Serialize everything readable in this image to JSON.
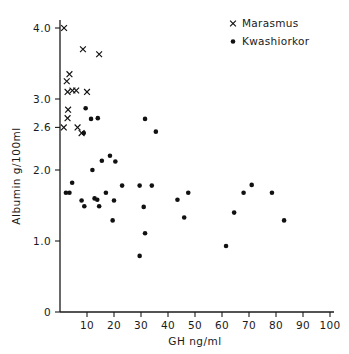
{
  "chart_data": {
    "type": "scatter",
    "title": "",
    "xlabel": "GH ng/ml",
    "ylabel": "Albumin g/100ml",
    "xlim": [
      0,
      100
    ],
    "ylim": [
      0,
      4.0
    ],
    "grid": false,
    "legend_position": "top-right",
    "xticks": [
      0,
      10,
      20,
      30,
      40,
      50,
      60,
      70,
      80,
      90,
      100
    ],
    "xtick_labels": [
      "",
      "10",
      "20",
      "30",
      "40",
      "50",
      "60",
      "70",
      "80",
      "90",
      "100"
    ],
    "yticks": [
      0,
      1.0,
      2.0,
      2.6,
      3.0,
      4.0
    ],
    "ytick_labels": [
      "0",
      "1.0",
      "2.0",
      "2.6",
      "3.0",
      "4.0"
    ],
    "series": [
      {
        "name": "Marasmus",
        "marker": "x",
        "color": "#111111",
        "points": [
          [
            1.5,
            4.0
          ],
          [
            8.5,
            3.7
          ],
          [
            14.5,
            3.63
          ],
          [
            3.5,
            3.35
          ],
          [
            2.5,
            3.25
          ],
          [
            2.8,
            3.1
          ],
          [
            4.6,
            3.12
          ],
          [
            6.0,
            3.12
          ],
          [
            10.0,
            3.1
          ],
          [
            3.0,
            2.85
          ],
          [
            2.8,
            2.73
          ],
          [
            1.4,
            2.6
          ],
          [
            6.5,
            2.6
          ],
          [
            8.0,
            2.52
          ]
        ]
      },
      {
        "name": "Kwashiorkor",
        "marker": "dot",
        "color": "#111111",
        "points": [
          [
            9.5,
            2.87
          ],
          [
            11.5,
            2.72
          ],
          [
            14.0,
            2.73
          ],
          [
            31.5,
            2.72
          ],
          [
            8.8,
            2.52
          ],
          [
            35.5,
            2.54
          ],
          [
            18.5,
            2.2
          ],
          [
            15.5,
            2.13
          ],
          [
            20.5,
            2.12
          ],
          [
            12.0,
            2.0
          ],
          [
            4.5,
            1.82
          ],
          [
            23.0,
            1.78
          ],
          [
            29.5,
            1.78
          ],
          [
            34.0,
            1.78
          ],
          [
            71.0,
            1.79
          ],
          [
            2.2,
            1.68
          ],
          [
            3.5,
            1.68
          ],
          [
            17.0,
            1.68
          ],
          [
            47.5,
            1.68
          ],
          [
            68.0,
            1.68
          ],
          [
            78.5,
            1.68
          ],
          [
            8.0,
            1.57
          ],
          [
            12.8,
            1.6
          ],
          [
            13.8,
            1.58
          ],
          [
            20.0,
            1.57
          ],
          [
            43.5,
            1.58
          ],
          [
            9.0,
            1.49
          ],
          [
            14.5,
            1.49
          ],
          [
            31.0,
            1.48
          ],
          [
            64.5,
            1.4
          ],
          [
            46.0,
            1.33
          ],
          [
            19.5,
            1.29
          ],
          [
            83.0,
            1.29
          ],
          [
            31.5,
            1.11
          ],
          [
            61.5,
            0.93
          ],
          [
            29.5,
            0.79
          ]
        ]
      }
    ]
  },
  "legend": {
    "entries": [
      {
        "label": "Marasmus",
        "marker": "x"
      },
      {
        "label": "Kwashiorkor",
        "marker": "dot"
      }
    ]
  }
}
